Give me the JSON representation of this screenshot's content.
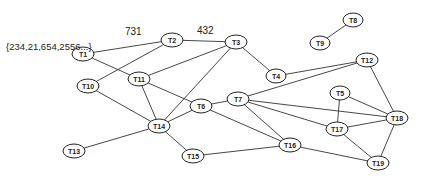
{
  "diagram": {
    "type": "undirected-graph",
    "annotation": {
      "text": "{234,21,654,2556...}",
      "x": 6,
      "y": 50,
      "attached_to": "T1"
    },
    "nodes": [
      {
        "id": "T1",
        "label": "T1",
        "x": 83,
        "y": 54,
        "rx": 11,
        "ry": 7
      },
      {
        "id": "T2",
        "label": "T2",
        "x": 172,
        "y": 40,
        "rx": 11,
        "ry": 7
      },
      {
        "id": "T3",
        "label": "T3",
        "x": 236,
        "y": 42,
        "rx": 11,
        "ry": 7
      },
      {
        "id": "T4",
        "label": "T4",
        "x": 276,
        "y": 76,
        "rx": 10,
        "ry": 7
      },
      {
        "id": "T5",
        "label": "T5",
        "x": 340,
        "y": 93,
        "rx": 10,
        "ry": 7
      },
      {
        "id": "T6",
        "label": "T6",
        "x": 201,
        "y": 106,
        "rx": 11,
        "ry": 7
      },
      {
        "id": "T7",
        "label": "T7",
        "x": 238,
        "y": 99,
        "rx": 11,
        "ry": 7
      },
      {
        "id": "T8",
        "label": "T8",
        "x": 353,
        "y": 20,
        "rx": 10,
        "ry": 7
      },
      {
        "id": "T9",
        "label": "T9",
        "x": 320,
        "y": 43,
        "rx": 10,
        "ry": 7
      },
      {
        "id": "T10",
        "label": "T10",
        "x": 88,
        "y": 86,
        "rx": 11,
        "ry": 7
      },
      {
        "id": "T11",
        "label": "T11",
        "x": 139,
        "y": 79,
        "rx": 11,
        "ry": 7
      },
      {
        "id": "T12",
        "label": "T12",
        "x": 367,
        "y": 60,
        "rx": 11,
        "ry": 7
      },
      {
        "id": "T13",
        "label": "T13",
        "x": 74,
        "y": 151,
        "rx": 11,
        "ry": 7
      },
      {
        "id": "T14",
        "label": "T14",
        "x": 159,
        "y": 126,
        "rx": 11,
        "ry": 7
      },
      {
        "id": "T15",
        "label": "T15",
        "x": 193,
        "y": 156,
        "rx": 11,
        "ry": 7
      },
      {
        "id": "T16",
        "label": "T16",
        "x": 290,
        "y": 145,
        "rx": 11,
        "ry": 7
      },
      {
        "id": "T17",
        "label": "T17",
        "x": 337,
        "y": 129,
        "rx": 11,
        "ry": 7
      },
      {
        "id": "T18",
        "label": "T18",
        "x": 397,
        "y": 118,
        "rx": 11,
        "ry": 7
      },
      {
        "id": "T19",
        "label": "T19",
        "x": 378,
        "y": 163,
        "rx": 11,
        "ry": 7
      }
    ],
    "edges": [
      {
        "from": "T1",
        "to": "T2",
        "label": "731",
        "label_x": 125,
        "label_y": 35
      },
      {
        "from": "T2",
        "to": "T3",
        "label": "432",
        "label_x": 197,
        "label_y": 34
      },
      {
        "from": "T1",
        "to": "T11",
        "label": ""
      },
      {
        "from": "T2",
        "to": "T10",
        "label": ""
      },
      {
        "from": "T3",
        "to": "T11",
        "label": ""
      },
      {
        "from": "T3",
        "to": "T14",
        "label": ""
      },
      {
        "from": "T3",
        "to": "T4",
        "label": ""
      },
      {
        "from": "T4",
        "to": "T12",
        "label": ""
      },
      {
        "from": "T8",
        "to": "T9",
        "label": ""
      },
      {
        "from": "T10",
        "to": "T14",
        "label": ""
      },
      {
        "from": "T11",
        "to": "T14",
        "label": ""
      },
      {
        "from": "T11",
        "to": "T6",
        "label": ""
      },
      {
        "from": "T6",
        "to": "T14",
        "label": ""
      },
      {
        "from": "T6",
        "to": "T7",
        "label": ""
      },
      {
        "from": "T6",
        "to": "T16",
        "label": ""
      },
      {
        "from": "T7",
        "to": "T12",
        "label": ""
      },
      {
        "from": "T7",
        "to": "T16",
        "label": ""
      },
      {
        "from": "T7",
        "to": "T17",
        "label": ""
      },
      {
        "from": "T7",
        "to": "T18",
        "label": ""
      },
      {
        "from": "T5",
        "to": "T17",
        "label": ""
      },
      {
        "from": "T5",
        "to": "T18",
        "label": ""
      },
      {
        "from": "T12",
        "to": "T18",
        "label": ""
      },
      {
        "from": "T17",
        "to": "T18",
        "label": ""
      },
      {
        "from": "T17",
        "to": "T19",
        "label": ""
      },
      {
        "from": "T18",
        "to": "T19",
        "label": ""
      },
      {
        "from": "T16",
        "to": "T19",
        "label": ""
      },
      {
        "from": "T15",
        "to": "T16",
        "label": ""
      },
      {
        "from": "T14",
        "to": "T15",
        "label": ""
      },
      {
        "from": "T13",
        "to": "T14",
        "label": ""
      }
    ]
  }
}
